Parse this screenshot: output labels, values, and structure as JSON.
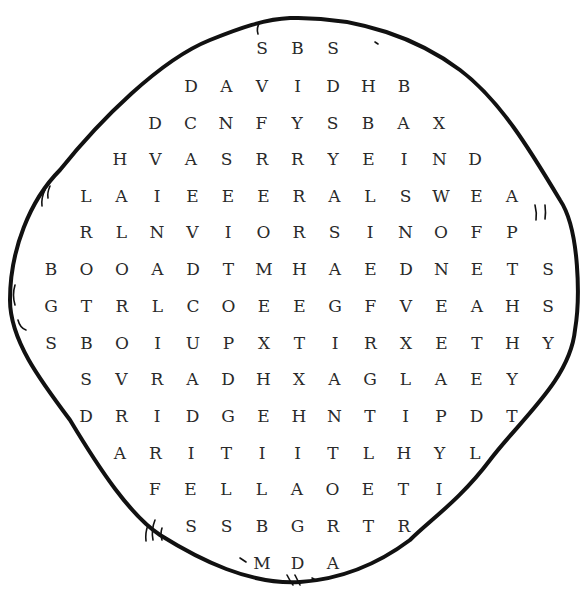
{
  "puzzle": {
    "type": "word-search",
    "shape": "blob",
    "colors": {
      "outline": "#111111",
      "letters": "#2a2a2a",
      "background": "#ffffff"
    },
    "rows": [
      {
        "y": 38,
        "x0": 262,
        "letters": [
          "S",
          "B",
          "S"
        ]
      },
      {
        "y": 76,
        "x0": 191,
        "letters": [
          "D",
          "A",
          "V",
          "I",
          "D",
          "H",
          "B"
        ]
      },
      {
        "y": 113,
        "x0": 155,
        "letters": [
          "D",
          "C",
          "N",
          "F",
          "Y",
          "S",
          "B",
          "A",
          "X"
        ]
      },
      {
        "y": 149,
        "x0": 120,
        "letters": [
          "H",
          "V",
          "A",
          "S",
          "R",
          "R",
          "Y",
          "E",
          "I",
          "N",
          "D"
        ]
      },
      {
        "y": 186,
        "x0": 86,
        "letters": [
          "L",
          "A",
          "I",
          "E",
          "E",
          "E",
          "R",
          "A",
          "L",
          "S",
          "W",
          "E",
          "A"
        ]
      },
      {
        "y": 222,
        "x0": 86,
        "letters": [
          "R",
          "L",
          "N",
          "V",
          "I",
          "O",
          "R",
          "S",
          "I",
          "N",
          "O",
          "F",
          "P"
        ]
      },
      {
        "y": 259,
        "x0": 51,
        "letters": [
          "B",
          "O",
          "O",
          "A",
          "D",
          "T",
          "M",
          "H",
          "A",
          "E",
          "D",
          "N",
          "E",
          "T",
          "S"
        ]
      },
      {
        "y": 296,
        "x0": 51,
        "letters": [
          "G",
          "T",
          "R",
          "L",
          "C",
          "O",
          "E",
          "E",
          "G",
          "F",
          "V",
          "E",
          "A",
          "H",
          "S"
        ]
      },
      {
        "y": 333,
        "x0": 51,
        "letters": [
          "S",
          "B",
          "O",
          "I",
          "U",
          "P",
          "X",
          "T",
          "I",
          "R",
          "X",
          "E",
          "T",
          "H",
          "Y"
        ]
      },
      {
        "y": 369,
        "x0": 86,
        "letters": [
          "S",
          "V",
          "R",
          "A",
          "D",
          "H",
          "X",
          "A",
          "G",
          "L",
          "A",
          "E",
          "Y"
        ]
      },
      {
        "y": 406,
        "x0": 86,
        "letters": [
          "D",
          "R",
          "I",
          "D",
          "G",
          "E",
          "H",
          "N",
          "T",
          "I",
          "P",
          "D",
          "T"
        ]
      },
      {
        "y": 443,
        "x0": 120,
        "letters": [
          "A",
          "R",
          "I",
          "T",
          "I",
          "I",
          "T",
          "L",
          "H",
          "Y",
          "L"
        ]
      },
      {
        "y": 479,
        "x0": 155,
        "letters": [
          "F",
          "E",
          "L",
          "L",
          "A",
          "O",
          "E",
          "T",
          "I"
        ]
      },
      {
        "y": 516,
        "x0": 191,
        "letters": [
          "S",
          "S",
          "B",
          "G",
          "R",
          "T",
          "R"
        ]
      },
      {
        "y": 553,
        "x0": 262,
        "letters": [
          "M",
          "D",
          "A"
        ]
      }
    ],
    "col_spacing": 35.5
  }
}
